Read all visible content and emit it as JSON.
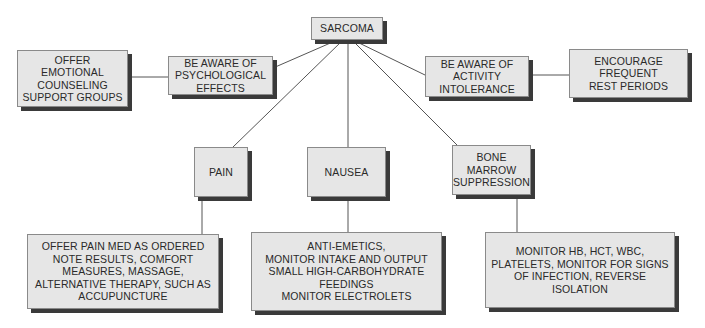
{
  "diagram": {
    "root": {
      "label": "SARCOMA"
    },
    "nodes": {
      "psych": {
        "label": "BE AWARE OF\nPSYCHOLOGICAL\nEFFECTS"
      },
      "psych_action": {
        "label": "OFFER\nEMOTIONAL\nCOUNSELING\nSUPPORT GROUPS"
      },
      "activity": {
        "label": "BE AWARE OF\nACTIVITY\nINTOLERANCE"
      },
      "activity_action": {
        "label": "ENCOURAGE\nFREQUENT\nREST PERIODS"
      },
      "pain": {
        "label": "PAIN"
      },
      "pain_action": {
        "label": "OFFER PAIN MED AS ORDERED\nNOTE RESULTS, COMFORT\nMEASURES, MASSAGE,\nALTERNATIVE THERAPY, SUCH AS\nACCUPUNCTURE"
      },
      "nausea": {
        "label": "NAUSEA"
      },
      "nausea_action": {
        "label": "ANTI-EMETICS,\nMONITOR INTAKE AND OUTPUT\nSMALL HIGH-CARBOHYDRATE\nFEEDINGS\nMONITOR ELECTROLETS"
      },
      "bone": {
        "label": "BONE\nMARROW\nSUPPRESSION"
      },
      "bone_action": {
        "label": "MONITOR HB, HCT, WBC,\nPLATELETS, MONITOR FOR SIGNS\nOF INFECTION, REVERSE ISOLATION"
      }
    },
    "edges": [
      [
        "root",
        "psych"
      ],
      [
        "root",
        "activity"
      ],
      [
        "root",
        "pain"
      ],
      [
        "root",
        "nausea"
      ],
      [
        "root",
        "bone"
      ],
      [
        "psych",
        "psych_action"
      ],
      [
        "activity",
        "activity_action"
      ],
      [
        "pain",
        "pain_action"
      ],
      [
        "nausea",
        "nausea_action"
      ],
      [
        "bone",
        "bone_action"
      ]
    ]
  }
}
